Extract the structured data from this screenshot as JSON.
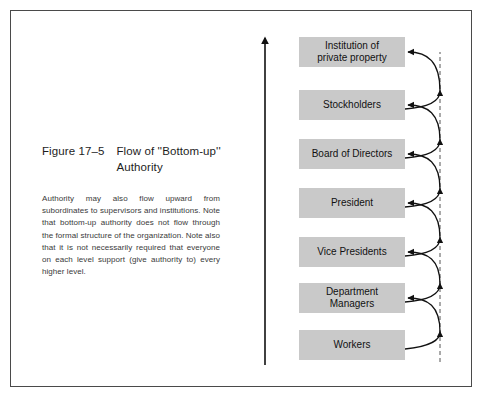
{
  "figure": {
    "number": "Figure 17–5",
    "title": "Flow of ''Bottom-up''\nAuthority",
    "caption": "Authority may also flow upward from subordinates to supervisors and institutions. Note that bottom-up authority does not flow through the formal structure of the organization. Note also that it is not necessarily required that everyone on each level support (give authority to) every higher level."
  },
  "colors": {
    "box_fill": "#c9c9c9",
    "border": "#4a4a4a",
    "line": "#111111",
    "background": "#ffffff"
  },
  "diagram": {
    "levels": [
      {
        "label": "Institution of\nprivate property"
      },
      {
        "label": "Stockholders"
      },
      {
        "label": "Board of Directors"
      },
      {
        "label": "President"
      },
      {
        "label": "Vice Presidents"
      },
      {
        "label": "Department\nManagers"
      },
      {
        "label": "Workers"
      }
    ],
    "upward_axis": {
      "direction": "up",
      "style": "solid"
    },
    "return_line": {
      "style": "dashed"
    }
  }
}
